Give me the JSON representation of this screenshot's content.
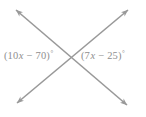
{
  "figure": {
    "width": 146,
    "height": 117,
    "background_color": "#ffffff",
    "line_color": "#999999",
    "text_color": "#8f8f8f",
    "stroke_width": 1.6
  },
  "labels": {
    "left": {
      "full_text": "(10x − 70)°",
      "open_paren": "(",
      "coefficient": "10",
      "variable": "x",
      "operator": "−",
      "constant": "70",
      "close_paren": ")",
      "degree": "°",
      "expression": "10x - 70",
      "position": "left-angle"
    },
    "right": {
      "full_text": "(7x − 25)°",
      "open_paren": "(",
      "coefficient": "7",
      "variable": "x",
      "operator": "−",
      "constant": "25",
      "close_paren": ")",
      "degree": "°",
      "expression": "7x - 25",
      "position": "right-angle"
    }
  },
  "geometry": {
    "intersection": {
      "x": 72,
      "y": 57
    },
    "lines": [
      {
        "name": "line-nw-se",
        "from": {
          "x": 16,
          "y": 10
        },
        "to": {
          "x": 127,
          "y": 105
        },
        "arrow_start": true,
        "arrow_end": true
      },
      {
        "name": "line-sw-ne",
        "from": {
          "x": 17,
          "y": 103
        },
        "to": {
          "x": 128,
          "y": 10
        },
        "arrow_start": true,
        "arrow_end": true
      }
    ],
    "arrowheads": [
      {
        "name": "arrowhead-top-left",
        "x": 16,
        "y": 10
      },
      {
        "name": "arrowhead-top-right",
        "x": 128,
        "y": 10
      },
      {
        "name": "arrowhead-bottom-left",
        "x": 17,
        "y": 103
      },
      {
        "name": "arrowhead-bottom-right",
        "x": 127,
        "y": 105
      }
    ]
  }
}
